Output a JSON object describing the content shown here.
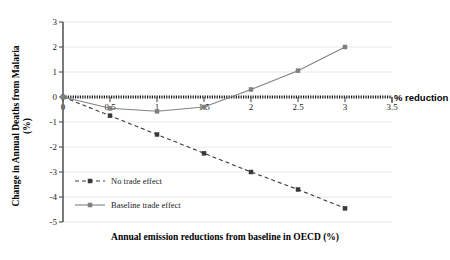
{
  "chart_data": {
    "type": "line",
    "title": "",
    "xlabel": "Annual emission reductions from baseline in OECD (%)",
    "ylabel": "Change in Annual Deaths from Malaria (%)",
    "ylabel_line1": "Change in Annual Deaths from Malaria",
    "ylabel_line2": "(%)",
    "axis_end_label": "% reduction",
    "x": [
      0,
      0.5,
      1,
      1.5,
      2,
      2.5,
      3
    ],
    "xlim": [
      0,
      3.5
    ],
    "ylim": [
      -5,
      3
    ],
    "xticks": [
      "0",
      "0.5",
      "1",
      "1.5",
      "2",
      "2.5",
      "3",
      "3.5"
    ],
    "xtick_values": [
      0,
      0.5,
      1,
      1.5,
      2,
      2.5,
      3,
      3.5
    ],
    "yticks": [
      "3",
      "2",
      "1",
      "0",
      "-1",
      "-2",
      "-3",
      "-4",
      "-5"
    ],
    "ytick_values": [
      3,
      2,
      1,
      0,
      -1,
      -2,
      -3,
      -4,
      -5
    ],
    "grid": "horizontal",
    "legend_position": "inside-lower-left",
    "series": [
      {
        "name": "No trade effect",
        "style": "dashed",
        "color": "#3a3a3a",
        "marker": "square",
        "values": [
          0,
          -0.75,
          -1.5,
          -2.25,
          -3.0,
          -3.7,
          -4.45
        ]
      },
      {
        "name": "Baseline trade effect",
        "style": "solid",
        "color": "#808080",
        "marker": "square",
        "values": [
          0,
          -0.45,
          -0.57,
          -0.4,
          0.3,
          1.05,
          2.0
        ]
      }
    ],
    "colors": {
      "no_trade_effect": "#3a3a3a",
      "baseline_trade_effect": "#808080",
      "axis": "#595959",
      "grid": "#e8e8e8",
      "zero_line": "#1a1a1a",
      "background": "#ffffff"
    }
  }
}
